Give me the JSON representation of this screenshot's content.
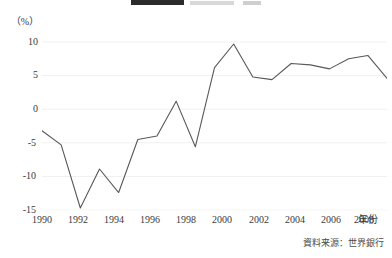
{
  "legend": {
    "swatch_color": "#2b2b2b",
    "clipped": true
  },
  "axes": {
    "y_unit_label": "（%）",
    "x_axis_title": "年份",
    "y_ticks": [
      "10",
      "5",
      "0",
      "-5",
      "-10",
      "-15"
    ],
    "x_ticks": [
      "1990",
      "1992",
      "1994",
      "1996",
      "1998",
      "2000",
      "2002",
      "2004",
      "2006",
      "2008"
    ]
  },
  "source_note": "資料来源：世界銀行",
  "chart_data": {
    "type": "line",
    "title": "",
    "xlabel": "年份",
    "ylabel": "（%）",
    "x": [
      1990,
      1991,
      1992,
      1993,
      1994,
      1995,
      1996,
      1997,
      1998,
      1999,
      2000,
      2001,
      2002,
      2003,
      2004,
      2005,
      2006,
      2007,
      2008
    ],
    "values": [
      -3.2,
      -5.3,
      -14.7,
      -8.9,
      -12.4,
      -4.5,
      -4.0,
      1.2,
      -5.6,
      6.2,
      9.7,
      4.8,
      4.4,
      6.8,
      6.6,
      6.0,
      7.5,
      8.0,
      4.6
    ],
    "series": [
      {
        "name": "",
        "values": [
          -3.2,
          -5.3,
          -14.7,
          -8.9,
          -12.4,
          -4.5,
          -4.0,
          1.2,
          -5.6,
          6.2,
          9.7,
          4.8,
          4.4,
          6.8,
          6.6,
          6.0,
          7.5,
          8.0,
          4.6
        ]
      }
    ],
    "xlim": [
      1990,
      2008
    ],
    "ylim": [
      -15,
      10
    ],
    "ytick_values": [
      10,
      5,
      0,
      -5,
      -10,
      -15
    ],
    "xtick_values": [
      1990,
      1992,
      1994,
      1996,
      1998,
      2000,
      2002,
      2004,
      2006,
      2008
    ],
    "grid": true,
    "grid_axis": "y",
    "line_color": "#58585a",
    "legend_position": "top"
  }
}
